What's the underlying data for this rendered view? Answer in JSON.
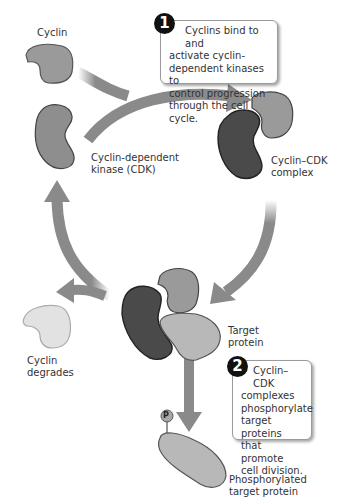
{
  "labels": {
    "cyclin": "Cyclin",
    "cdk_line1": "Cyclin-dependent",
    "cdk_line2": "kinase (CDK)",
    "complex_line1": "Cyclin–CDK",
    "complex_line2": "complex",
    "target_line1": "Target",
    "target_line2": "protein",
    "degrades_line1": "Cyclin",
    "degrades_line2": "degrades",
    "phospho_line1": "Phosphorylated",
    "phospho_line2": "target protein",
    "phosphate_symbol": "P"
  },
  "callouts": [
    {
      "number": "1",
      "lines": [
        "Cyclins bind to and",
        "activate cyclin-",
        "dependent kinases to",
        "control progression",
        "through the cell cycle."
      ]
    },
    {
      "number": "2",
      "lines": [
        "Cyclin–CDK",
        "complexes",
        "phosphorylate",
        "target proteins",
        "that promote",
        "cell division."
      ]
    }
  ],
  "colors": {
    "cyclin": "#9a9a9a",
    "cdk": "#8e8e8e",
    "cdk_in_complex": "#4a4a4a",
    "target_protein": "#b8b8b8",
    "degraded_cyclin": "#e2e2e2",
    "arrow": "#8a8a8a"
  }
}
